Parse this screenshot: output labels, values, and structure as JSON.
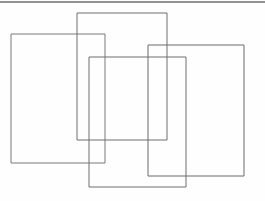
{
  "page": {
    "width": 265,
    "height": 201,
    "background_color": "#fefefe"
  },
  "palette": {
    "line_color": "#6f6f6f",
    "line_color_dark": "#5a5a5a",
    "line_color_light": "#8b8b8b",
    "background": "#fefefe",
    "top_band_color": "#565656"
  },
  "artifacts": {
    "top_scan_band": {
      "name": "top-scan-edge",
      "x1": 0,
      "y1": 2,
      "x2": 265,
      "y2": 2,
      "stroke": "#565656",
      "stroke_width": 1.6,
      "opacity": 0.85
    }
  },
  "shapes": [
    {
      "id": "rect-1",
      "label": "left rectangle",
      "x": 11,
      "y": 34,
      "width": 94,
      "height": 129,
      "stroke": "#7a7a7a",
      "stroke_width": 1,
      "fill": "none"
    },
    {
      "id": "rect-2",
      "label": "upper middle rectangle",
      "x": 77,
      "y": 13,
      "width": 90,
      "height": 127,
      "stroke": "#6f6f6f",
      "stroke_width": 1,
      "fill": "none"
    },
    {
      "id": "rect-3",
      "label": "right rectangle",
      "x": 148,
      "y": 45,
      "width": 96,
      "height": 131,
      "stroke": "#6a6a6a",
      "stroke_width": 1,
      "fill": "none"
    },
    {
      "id": "rect-4",
      "label": "lower middle rectangle",
      "x": 89,
      "y": 57,
      "width": 97,
      "height": 130,
      "stroke": "#6f6f6f",
      "stroke_width": 1,
      "fill": "none"
    }
  ],
  "counts": {
    "rectangle_count": 4
  }
}
